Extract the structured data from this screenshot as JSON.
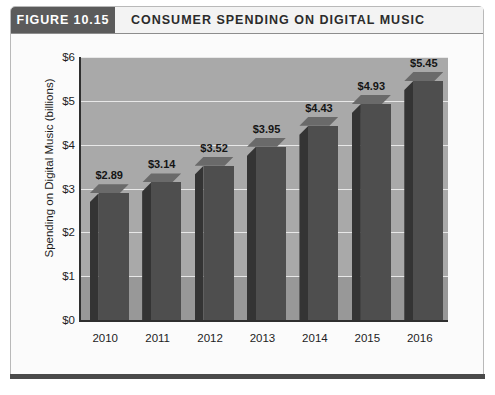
{
  "figure": {
    "tag": "FIGURE 10.15",
    "title": "CONSUMER SPENDING ON DIGITAL MUSIC"
  },
  "colors": {
    "tag_bg": "#5b5b5b",
    "plot_bg": "#a9a9a9",
    "floor_bg": "#989898",
    "bar_front": "#4e4e4e",
    "bar_left": "#343434",
    "bar_top": "#6a6a6a",
    "gridline": "#e8e8e8",
    "axis": "#2f2f2f",
    "card_border": "#b9b9b9",
    "bottom_bar": "#4a4a4a"
  },
  "chart_data": {
    "type": "bar",
    "title": "CONSUMER SPENDING ON DIGITAL MUSIC",
    "xlabel": "",
    "ylabel": "Spending on Digital Music  (billions)",
    "categories": [
      "2010",
      "2011",
      "2012",
      "2013",
      "2014",
      "2015",
      "2016"
    ],
    "values": [
      2.89,
      3.14,
      3.52,
      3.95,
      4.43,
      4.93,
      5.45
    ],
    "data_labels": [
      "$2.89",
      "$3.14",
      "$3.52",
      "$3.95",
      "$4.43",
      "$4.93",
      "$5.45"
    ],
    "ylim": [
      0,
      6
    ],
    "ytick_values": [
      0,
      1,
      2,
      3,
      4,
      5,
      6
    ],
    "ytick_labels": [
      "$0",
      "$1",
      "$2",
      "$3",
      "$4",
      "$5",
      "$6"
    ],
    "grid": true,
    "legend": false,
    "three_d": true
  }
}
